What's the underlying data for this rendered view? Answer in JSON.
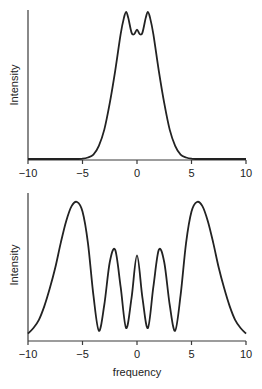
{
  "chart_data": [
    {
      "type": "line",
      "title": "",
      "xlabel": "",
      "ylabel": "Intensity",
      "xlim": [
        -10,
        10
      ],
      "ylim": [
        0,
        1
      ],
      "xticks": [
        -10,
        -5,
        0,
        5,
        10
      ],
      "xtick_labels": [
        "−10",
        "−5",
        "0",
        "5",
        "10"
      ],
      "grid": false,
      "legend": null,
      "series": [
        {
          "name": "spectrum",
          "x": [
            -10,
            -6,
            -5,
            -4.5,
            -4,
            -3.5,
            -3,
            -2.5,
            -2,
            -1.5,
            -1.2,
            -1,
            -0.8,
            -0.5,
            -0.25,
            0,
            0.25,
            0.5,
            0.8,
            1,
            1.2,
            1.5,
            2,
            2.5,
            3,
            3.5,
            4,
            4.5,
            5,
            6,
            10
          ],
          "y": [
            0,
            0,
            0.002,
            0.01,
            0.03,
            0.09,
            0.2,
            0.38,
            0.6,
            0.85,
            0.96,
            1.0,
            0.96,
            0.86,
            0.85,
            0.88,
            0.85,
            0.86,
            0.96,
            1.0,
            0.96,
            0.85,
            0.6,
            0.38,
            0.2,
            0.09,
            0.03,
            0.01,
            0.002,
            0,
            0
          ]
        }
      ]
    },
    {
      "type": "line",
      "title": "",
      "xlabel": "frequency",
      "ylabel": "Intensity",
      "xlim": [
        -10,
        10
      ],
      "ylim": [
        0,
        1
      ],
      "xticks": [
        -10,
        -5,
        0,
        5,
        10
      ],
      "xtick_labels": [
        "−10",
        "−5",
        "0",
        "5",
        "10"
      ],
      "grid": false,
      "legend": null,
      "series": [
        {
          "name": "spectrum",
          "x": [
            -10,
            -9.5,
            -9,
            -8.5,
            -8,
            -7.5,
            -7,
            -6.5,
            -6,
            -5.5,
            -5,
            -4.5,
            -4,
            -3.5,
            -3,
            -2.5,
            -2,
            -1.5,
            -1,
            -0.5,
            0,
            0.5,
            1,
            1.5,
            2,
            2.5,
            3,
            3.5,
            4,
            4.5,
            5,
            5.5,
            6,
            6.5,
            7,
            7.5,
            8,
            8.5,
            9,
            9.5,
            10
          ],
          "y": [
            0.04,
            0.08,
            0.14,
            0.24,
            0.37,
            0.52,
            0.7,
            0.86,
            0.97,
            1.0,
            0.93,
            0.7,
            0.32,
            0.06,
            0.25,
            0.56,
            0.65,
            0.38,
            0.08,
            0.3,
            0.61,
            0.3,
            0.08,
            0.38,
            0.65,
            0.56,
            0.25,
            0.06,
            0.32,
            0.7,
            0.93,
            1.0,
            0.97,
            0.86,
            0.7,
            0.52,
            0.37,
            0.24,
            0.14,
            0.08,
            0.04
          ]
        }
      ]
    }
  ],
  "plots": {
    "top": {
      "ylabel": "Intensity"
    },
    "bottom": {
      "ylabel": "Intensity",
      "xlabel": "frequency"
    }
  },
  "ticks": [
    "−10",
    "−5",
    "0",
    "5",
    "10"
  ]
}
